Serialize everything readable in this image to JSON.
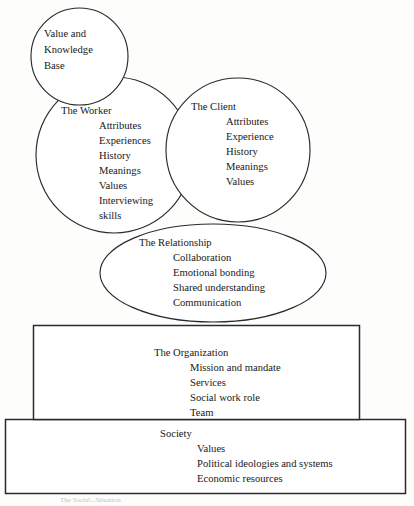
{
  "figure": {
    "caption_partial": "The Social...Situation"
  },
  "nodes": {
    "value_base": {
      "shape": "circle",
      "lines": [
        "Value and",
        "Knowledge",
        "Base"
      ]
    },
    "worker": {
      "shape": "circle",
      "heading": "The Worker",
      "items": [
        "Attributes",
        "Experiences",
        "History",
        "Meanings",
        "Values",
        "Interviewing",
        "skills"
      ]
    },
    "client": {
      "shape": "circle",
      "heading": "The Client",
      "items": [
        "Attributes",
        "Experience",
        "History",
        "Meanings",
        "Values"
      ]
    },
    "relationship": {
      "shape": "ellipse",
      "heading": "The Relationship",
      "items": [
        "Collaboration",
        "Emotional bonding",
        "Shared understanding",
        "Communication"
      ]
    },
    "organization": {
      "shape": "rectangle",
      "heading": "The Organization",
      "items": [
        "Mission and mandate",
        "Services",
        "Social work role",
        "Team"
      ]
    },
    "society": {
      "shape": "rectangle",
      "heading": "Society",
      "items": [
        "Values",
        "Political ideologies and systems",
        "Economic resources"
      ]
    }
  },
  "colors": {
    "stroke": "#2a2a2a",
    "text": "#181818",
    "background": "#fdfdfc"
  }
}
